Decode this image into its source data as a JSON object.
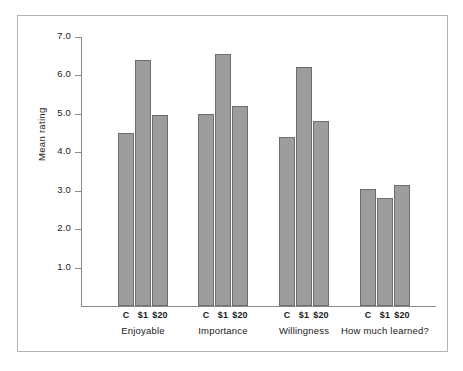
{
  "chart_data": {
    "type": "bar",
    "title": "",
    "subtitle": "",
    "xlabel": "",
    "ylabel": "Mean rating",
    "ylim": [
      0.0,
      7.0
    ],
    "ytick_labels": [
      "7.0",
      "6.0",
      "5.0",
      "4.0",
      "3.0",
      "2.0",
      "1.0"
    ],
    "ytick_values": [
      7.0,
      6.0,
      5.0,
      4.0,
      3.0,
      2.0,
      1.0
    ],
    "grid": false,
    "legend": null,
    "categories": [
      "Enjoyable",
      "Importance",
      "Willingness",
      "How much learned?"
    ],
    "condition_labels": [
      "C",
      "$1",
      "$20"
    ],
    "series": [
      {
        "name": "C",
        "values": [
          4.5,
          5.0,
          4.4,
          3.05
        ]
      },
      {
        "name": "$1",
        "values": [
          6.4,
          6.55,
          6.2,
          2.8
        ]
      },
      {
        "name": "$20",
        "values": [
          4.95,
          5.2,
          4.8,
          3.15
        ]
      }
    ],
    "groups": [
      {
        "label": "Enjoyable",
        "bars": [
          {
            "label": "C",
            "value": 4.5
          },
          {
            "label": "$1",
            "value": 6.4
          },
          {
            "label": "$20",
            "value": 4.95
          }
        ]
      },
      {
        "label": "Importance",
        "bars": [
          {
            "label": "C",
            "value": 5.0
          },
          {
            "label": "$1",
            "value": 6.55
          },
          {
            "label": "$20",
            "value": 5.2
          }
        ]
      },
      {
        "label": "Willingness",
        "bars": [
          {
            "label": "C",
            "value": 4.4
          },
          {
            "label": "$1",
            "value": 6.2
          },
          {
            "label": "$20",
            "value": 4.8
          }
        ]
      },
      {
        "label": "How much learned?",
        "bars": [
          {
            "label": "C",
            "value": 3.05
          },
          {
            "label": "$1",
            "value": 2.8
          },
          {
            "label": "$20",
            "value": 3.15
          }
        ]
      }
    ],
    "colors": {
      "bar_fill": "#9d9d9d",
      "bar_stroke": "#6e6e6e",
      "axis": "#8a8a8a",
      "text": "#1a1a1a",
      "frame": "#b3b3b3",
      "background": "#ffffff"
    }
  }
}
